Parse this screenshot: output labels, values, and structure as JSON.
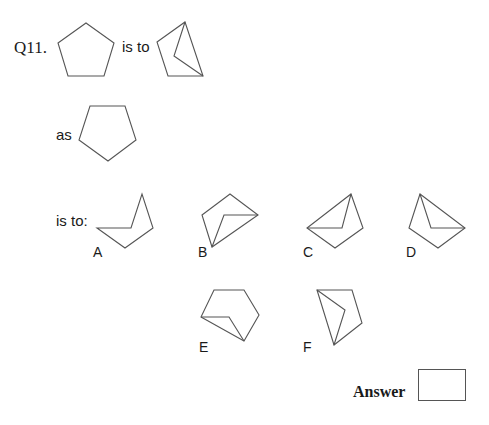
{
  "question": {
    "number": "Q11.",
    "phrase_is_to": "is to",
    "phrase_as": "as",
    "phrase_is_to_colon": "is to:"
  },
  "figures": {
    "source": "regular-pentagon",
    "source_transformed": "pentagon-with-top-left-corner-folded-inward",
    "target": "inverted-regular-pentagon"
  },
  "options": [
    {
      "label": "A"
    },
    {
      "label": "B"
    },
    {
      "label": "C"
    },
    {
      "label": "D"
    },
    {
      "label": "E"
    },
    {
      "label": "F"
    }
  ],
  "answer": {
    "label": "Answer",
    "value": ""
  },
  "colors": {
    "stroke": "#555555",
    "text": "#1a1a1a",
    "background": "#ffffff"
  }
}
